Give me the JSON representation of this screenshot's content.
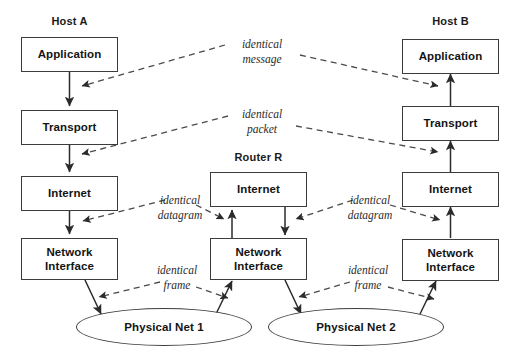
{
  "diagram": {
    "columns": [
      {
        "id": "host-a",
        "heading": "Host A",
        "layers": [
          {
            "id": "application",
            "label": "Application"
          },
          {
            "id": "transport",
            "label": "Transport"
          },
          {
            "id": "internet",
            "label": "Internet"
          },
          {
            "id": "network-interface",
            "line1": "Network",
            "line2": "Interface"
          }
        ]
      },
      {
        "id": "router-r",
        "heading": "Router R",
        "layers": [
          {
            "id": "internet",
            "label": "Internet"
          },
          {
            "id": "network-interface",
            "line1": "Network",
            "line2": "Interface"
          }
        ]
      },
      {
        "id": "host-b",
        "heading": "Host B",
        "layers": [
          {
            "id": "application",
            "label": "Application"
          },
          {
            "id": "transport",
            "label": "Transport"
          },
          {
            "id": "internet",
            "label": "Internet"
          },
          {
            "id": "network-interface",
            "line1": "Network",
            "line2": "Interface"
          }
        ]
      }
    ],
    "networks": [
      {
        "id": "physical-net-1",
        "label": "Physical Net 1"
      },
      {
        "id": "physical-net-2",
        "label": "Physical Net 2"
      }
    ],
    "annotations": [
      {
        "id": "identical-message",
        "line1": "identical",
        "line2": "message"
      },
      {
        "id": "identical-packet",
        "line1": "identical",
        "line2": "packet"
      },
      {
        "id": "identical-datagram-1",
        "line1": "identical",
        "line2": "datagram"
      },
      {
        "id": "identical-datagram-2",
        "line1": "identical",
        "line2": "datagram"
      },
      {
        "id": "identical-frame-1",
        "line1": "identical",
        "line2": "frame"
      },
      {
        "id": "identical-frame-2",
        "line1": "identical",
        "line2": "frame"
      }
    ],
    "colors": {
      "box_stroke": "#3c3c3c",
      "text": "#141414",
      "annotation_text": "#2b2b2b",
      "arrow": "#2b2b2b",
      "dash": "#4a4a4a",
      "background": "#ffffff"
    }
  }
}
